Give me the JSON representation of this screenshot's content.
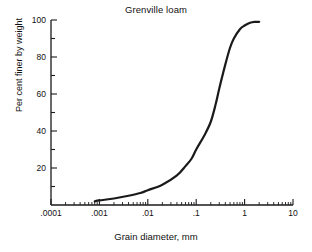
{
  "chart_data": {
    "type": "line",
    "title": "Grenville loam",
    "xlabel": "Grain diameter, mm",
    "ylabel": "Per cent finer by weight",
    "xscale": "log",
    "xlim": [
      0.0001,
      10
    ],
    "ylim": [
      0,
      100
    ],
    "grid": false,
    "legend": null,
    "xticks": [
      0.0001,
      0.001,
      0.01,
      0.1,
      1,
      10
    ],
    "xtick_labels": [
      ".0001",
      ".001",
      ".01",
      ".1",
      "1",
      "10"
    ],
    "xminor_ticks": true,
    "yticks": [
      0,
      20,
      40,
      60,
      80,
      100
    ],
    "ytick_labels": [
      "",
      "20",
      "40",
      "60",
      "80",
      "100"
    ],
    "series": [
      {
        "name": "Grenville loam",
        "color": "#1a1a1a",
        "linewidth": 2.2,
        "x": [
          0.0008,
          0.001,
          0.002,
          0.004,
          0.007,
          0.01,
          0.02,
          0.04,
          0.06,
          0.08,
          0.1,
          0.15,
          0.2,
          0.25,
          0.3,
          0.4,
          0.5,
          0.6,
          0.8,
          1.0,
          1.3,
          1.6,
          2.0
        ],
        "y": [
          2,
          2.5,
          3.5,
          5,
          6.5,
          8,
          11,
          16,
          21,
          25,
          30,
          38,
          45,
          54,
          63,
          76,
          85,
          90,
          95,
          97,
          98.5,
          99,
          99
        ]
      }
    ]
  }
}
